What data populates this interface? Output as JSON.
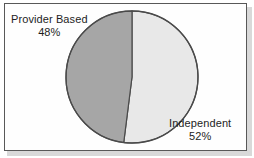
{
  "figure": {
    "background_color": "#ffffff",
    "frame_border_color": "#585858",
    "shadow_color": "#b9b9b9"
  },
  "labels": {
    "provider_based": {
      "name": "Provider Based",
      "percent": "48%"
    },
    "independent": {
      "name": "Independent",
      "percent": "52%"
    }
  },
  "chart_data": {
    "type": "pie",
    "title": "",
    "subtitle": "",
    "xlabel": "",
    "ylabel": "",
    "categories": [
      "Independent",
      "Provider Based"
    ],
    "values": [
      52,
      48
    ],
    "value_unit": "%",
    "slices": [
      {
        "label": "Independent",
        "value": 52,
        "display": "52%",
        "color": "#e8e8e8",
        "start_angle_deg": 0,
        "end_angle_deg": 187.2,
        "side": "right"
      },
      {
        "label": "Provider Based",
        "value": 48,
        "display": "48%",
        "color": "#a6a6a6",
        "start_angle_deg": 187.2,
        "end_angle_deg": 360,
        "side": "left"
      }
    ],
    "start_angle_deg": 0,
    "direction": "clockwise",
    "slice_outline_color": "#4a4a4a",
    "legend": "none",
    "labels_position": "outside",
    "grid": false
  }
}
